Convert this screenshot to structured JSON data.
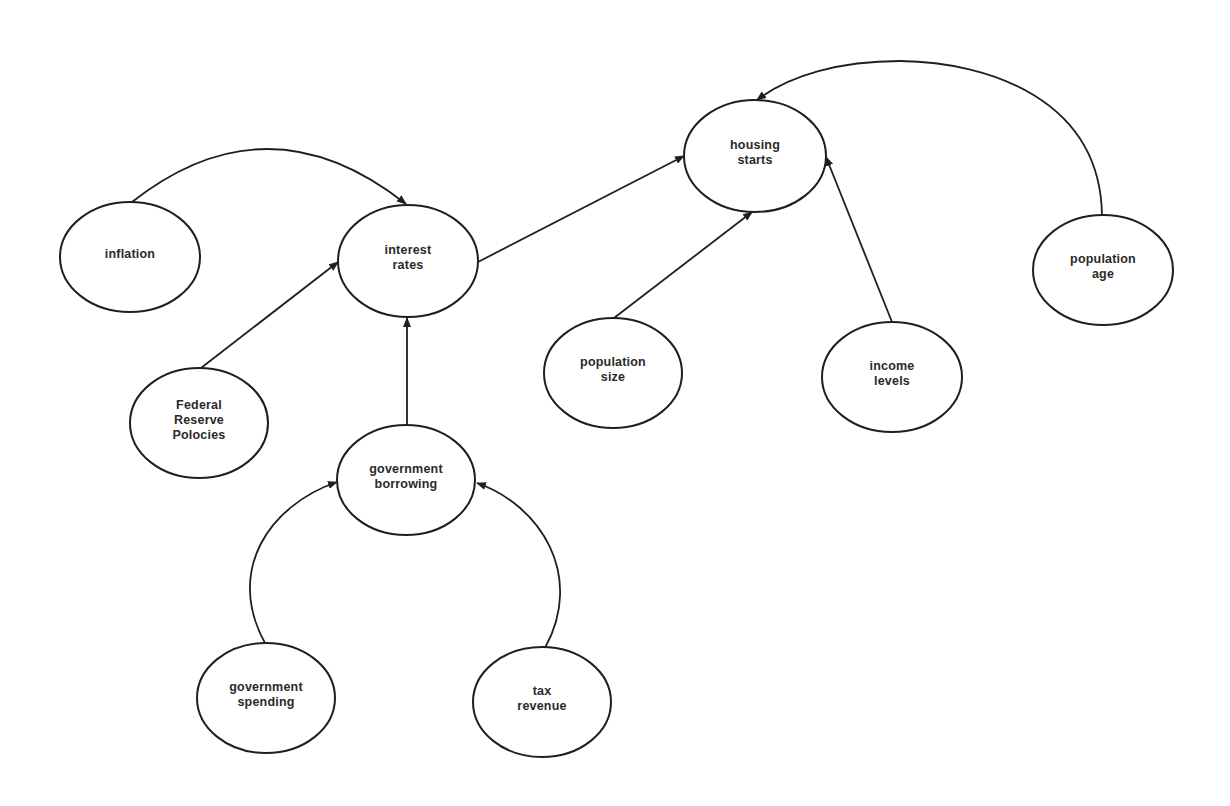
{
  "diagram": {
    "type": "causal-concept-map",
    "colors": {
      "background": "#ffffff",
      "stroke": "#1f1f1f",
      "text": "#2a2a2a"
    },
    "nodes": [
      {
        "id": "inflation",
        "label": "inflation",
        "cx": 130,
        "cy": 257,
        "rx": 70,
        "ry": 55
      },
      {
        "id": "interest_rates",
        "label": "interest\nrates",
        "cx": 408,
        "cy": 261,
        "rx": 70,
        "ry": 56
      },
      {
        "id": "housing_starts",
        "label": "housing\nstarts",
        "cx": 755,
        "cy": 156,
        "rx": 71,
        "ry": 56
      },
      {
        "id": "population_age",
        "label": "population\nage",
        "cx": 1103,
        "cy": 270,
        "rx": 70,
        "ry": 55
      },
      {
        "id": "federal_reserve_policies",
        "label": "Federal\nReserve\nPolocies",
        "cx": 199,
        "cy": 423,
        "rx": 69,
        "ry": 55
      },
      {
        "id": "government_borrowing",
        "label": "government\nborrowing",
        "cx": 406,
        "cy": 480,
        "rx": 69,
        "ry": 55
      },
      {
        "id": "population_size",
        "label": "population\nsize",
        "cx": 613,
        "cy": 373,
        "rx": 69,
        "ry": 55
      },
      {
        "id": "income_levels",
        "label": "income\nlevels",
        "cx": 892,
        "cy": 377,
        "rx": 70,
        "ry": 55
      },
      {
        "id": "government_spending",
        "label": "government\nspending",
        "cx": 266,
        "cy": 698,
        "rx": 69,
        "ry": 55
      },
      {
        "id": "tax_revenue",
        "label": "tax\nrevenue",
        "cx": 542,
        "cy": 702,
        "rx": 69,
        "ry": 55
      }
    ],
    "edges": [
      {
        "from": "inflation",
        "to": "interest_rates",
        "path": "M 132 202 Q 268 95 406 204"
      },
      {
        "from": "federal_reserve_policies",
        "to": "interest_rates",
        "path": "M 201 368 L 338 262"
      },
      {
        "from": "government_borrowing",
        "to": "interest_rates",
        "path": "M 407 425 L 407 318"
      },
      {
        "from": "interest_rates",
        "to": "housing_starts",
        "path": "M 478 262 L 684 156"
      },
      {
        "from": "population_size",
        "to": "housing_starts",
        "path": "M 614 318 L 752 212"
      },
      {
        "from": "income_levels",
        "to": "housing_starts",
        "path": "M 892 322 L 826 157"
      },
      {
        "from": "population_age",
        "to": "housing_starts",
        "path": "M 1102 215 C 1100 100 990 62 900 61 C 840 61 790 75 757 100"
      },
      {
        "from": "government_spending",
        "to": "government_borrowing",
        "path": "M 265 643 C 225 570 270 505 337 482"
      },
      {
        "from": "tax_revenue",
        "to": "government_borrowing",
        "path": "M 545 648 C 585 575 540 505 477 483"
      }
    ]
  }
}
